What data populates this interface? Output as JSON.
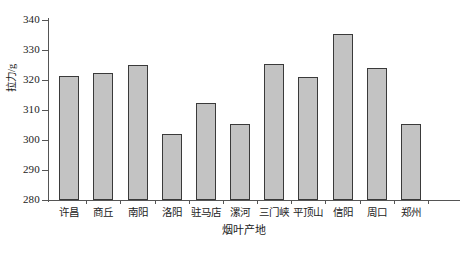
{
  "chart_data": {
    "type": "bar",
    "title": "",
    "xlabel": "烟叶产地",
    "ylabel": "拉力/g",
    "ylim": [
      280,
      340
    ],
    "yticks": [
      280,
      290,
      300,
      310,
      320,
      330,
      340
    ],
    "ytick_labels": [
      "280",
      "290",
      "300",
      "310",
      "320",
      "330",
      "340"
    ],
    "grid": false,
    "legend": false,
    "categories": [
      "许昌",
      "商丘",
      "南阳",
      "洛阳",
      "驻马店",
      "漯河",
      "三门峡",
      "平顶山",
      "信阳",
      "周口",
      "郑州"
    ],
    "values": [
      321.5,
      322.5,
      325.0,
      302.0,
      312.5,
      305.5,
      325.5,
      321.0,
      335.5,
      324.0,
      305.5
    ],
    "series": [
      {
        "name": "拉力",
        "values": [
          321.5,
          322.5,
          325.0,
          302.0,
          312.5,
          305.5,
          325.5,
          321.0,
          335.5,
          324.0,
          305.5
        ]
      }
    ],
    "bar_fill_color": "#c3c3c3",
    "bar_edge_color": "#3a3a3a",
    "axis_color": "#555555",
    "background_color": "#ffffff"
  }
}
